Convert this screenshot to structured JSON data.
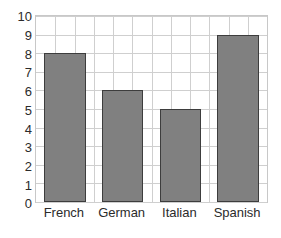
{
  "chart_data": {
    "type": "bar",
    "title": "",
    "subtitle": "",
    "xlabel": "",
    "ylabel": "",
    "categories": [
      "French",
      "German",
      "Italian",
      "Spanish"
    ],
    "values": [
      8,
      6,
      5,
      9
    ],
    "series": [
      {
        "name": "",
        "values": [
          8,
          6,
          5,
          9
        ]
      }
    ],
    "ylim": [
      0,
      10
    ],
    "y_ticks": [
      0,
      1,
      2,
      3,
      4,
      5,
      6,
      7,
      8,
      9,
      10
    ],
    "y_tick_labels": [
      "0",
      "1",
      "2",
      "3",
      "4",
      "5",
      "6",
      "7",
      "8",
      "9",
      "10"
    ],
    "grid": true,
    "grid_vertical_divisions": 12,
    "legend": null,
    "legend_position": "none",
    "annotations": [],
    "colors": {
      "bar_fill": "#808080",
      "bar_border": "#3d3d3d",
      "gridline": "#cfcfcf",
      "axis": "#c8c8c8",
      "text": "#2b2b2b",
      "background": "#ffffff"
    }
  }
}
